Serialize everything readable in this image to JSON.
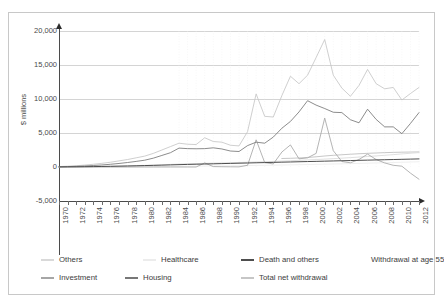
{
  "top_fragment": "",
  "chart_data": {
    "type": "line",
    "title": "",
    "subtitle": "",
    "xlabel": "",
    "ylabel": "$ millions",
    "ylim": [
      -5000,
      20000
    ],
    "xlim": [
      1970,
      2012
    ],
    "grid": true,
    "legend_position": "bottom",
    "ytick_labels": [
      "20,000",
      "15,000",
      "10,000",
      "5,000",
      "0",
      "-5,000"
    ],
    "ytick_values": [
      20000,
      15000,
      10000,
      5000,
      0,
      -5000
    ],
    "xtick_labels": [
      "1970",
      "1972",
      "1974",
      "1976",
      "1978",
      "1980",
      "1982",
      "1984",
      "1986",
      "1988",
      "1990",
      "1992",
      "1994",
      "1996",
      "1998",
      "2000",
      "2002",
      "2004",
      "2006",
      "2008",
      "2010",
      "2012"
    ],
    "x": [
      1970,
      1971,
      1972,
      1973,
      1974,
      1975,
      1976,
      1977,
      1978,
      1979,
      1980,
      1981,
      1982,
      1983,
      1984,
      1985,
      1986,
      1987,
      1988,
      1989,
      1990,
      1991,
      1992,
      1993,
      1994,
      1995,
      1996,
      1997,
      1998,
      1999,
      2000,
      2001,
      2002,
      2003,
      2004,
      2005,
      2006,
      2007,
      2008,
      2009,
      2010,
      2011,
      2012
    ],
    "series": [
      {
        "name": "Others",
        "color": "#d9d9d9",
        "values": [
          20,
          30,
          40,
          50,
          70,
          90,
          110,
          140,
          170,
          200,
          240,
          280,
          330,
          380,
          430,
          470,
          500,
          540,
          570,
          600,
          630,
          660,
          700,
          740,
          780,
          820,
          870,
          920,
          980,
          1040,
          1100,
          1160,
          1230,
          1300,
          1380,
          1460,
          1540,
          1630,
          1720,
          1820,
          1920,
          2020,
          2120
        ]
      },
      {
        "name": "Healthcare",
        "color": "#ececec",
        "values": [
          5,
          8,
          10,
          14,
          18,
          22,
          28,
          34,
          40,
          48,
          56,
          64,
          74,
          84,
          96,
          108,
          120,
          134,
          148,
          162,
          178,
          194,
          212,
          230,
          250,
          270,
          292,
          314,
          338,
          362,
          388,
          414,
          442,
          470,
          500,
          530,
          562,
          594,
          628,
          662,
          698,
          734,
          772
        ]
      },
      {
        "name": "Death and others",
        "color": "#4e4e4e",
        "values": [
          10,
          20,
          30,
          45,
          60,
          80,
          100,
          125,
          150,
          180,
          210,
          240,
          275,
          310,
          345,
          380,
          410,
          440,
          470,
          500,
          530,
          560,
          590,
          620,
          650,
          680,
          710,
          740,
          770,
          800,
          830,
          860,
          890,
          920,
          950,
          980,
          1010,
          1040,
          1070,
          1100,
          1130,
          1160,
          1190
        ]
      },
      {
        "name": "Withdrawal at age 55",
        "color": "#bdbdbd",
        "values": [
          0,
          0,
          0,
          0,
          0,
          0,
          0,
          0,
          0,
          0,
          0,
          0,
          0,
          0,
          0,
          0,
          0,
          0,
          0,
          0,
          0,
          0,
          0,
          0,
          0,
          0,
          1250,
          1280,
          1330,
          1400,
          1500,
          1620,
          1720,
          1800,
          1880,
          1950,
          2010,
          2060,
          2110,
          2150,
          2180,
          2200,
          2220
        ]
      },
      {
        "name": "Investment",
        "color": "#a6a6a6",
        "values": [
          0,
          0,
          0,
          0,
          0,
          0,
          0,
          0,
          0,
          0,
          0,
          0,
          0,
          0,
          0,
          0,
          0,
          600,
          60,
          40,
          30,
          20,
          250,
          4000,
          650,
          450,
          2200,
          3250,
          1200,
          1350,
          2000,
          7200,
          2400,
          800,
          620,
          1100,
          1900,
          1100,
          600,
          250,
          120,
          -900,
          -1800
        ]
      },
      {
        "name": "Housing",
        "color": "#777777",
        "values": [
          30,
          60,
          100,
          150,
          220,
          300,
          400,
          520,
          660,
          820,
          1000,
          1300,
          1700,
          2100,
          2780,
          2700,
          2680,
          2700,
          2820,
          2650,
          2350,
          2280,
          3150,
          3650,
          3500,
          4400,
          5700,
          6700,
          8100,
          9750,
          9100,
          8600,
          8050,
          8000,
          6950,
          6500,
          8500,
          7000,
          5900,
          5900,
          4900,
          6400,
          8000
        ]
      },
      {
        "name": "Total net withdrawal",
        "color": "#c6c6c6",
        "values": [
          60,
          120,
          190,
          280,
          400,
          540,
          700,
          900,
          1100,
          1350,
          1600,
          2000,
          2500,
          3000,
          3500,
          3350,
          3300,
          4300,
          3750,
          3650,
          3200,
          3100,
          5200,
          10750,
          7450,
          7350,
          10500,
          13350,
          12250,
          13500,
          16100,
          18750,
          13500,
          11600,
          10400,
          12000,
          14350,
          12250,
          11500,
          11700,
          9850,
          10800,
          11700
        ]
      }
    ]
  },
  "legend": {
    "row1": [
      {
        "label": "Others",
        "color": "#d9d9d9"
      },
      {
        "label": "Healthcare",
        "color": "#ececec"
      },
      {
        "label": "Death and others",
        "color": "#4e4e4e"
      },
      {
        "label": "Withdrawal at age 55",
        "color": "#ffffff"
      }
    ],
    "row2": [
      {
        "label": "Investment",
        "color": "#a6a6a6"
      },
      {
        "label": "Housing",
        "color": "#777777"
      },
      {
        "label": "Total net withdrawal",
        "color": "#c6c6c6"
      }
    ]
  }
}
